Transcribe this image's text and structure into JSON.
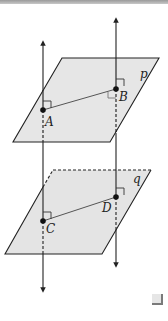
{
  "diagram": {
    "planes": [
      {
        "id": "p",
        "label": "p"
      },
      {
        "id": "q",
        "label": "q"
      }
    ],
    "points": [
      {
        "id": "A",
        "label": "A",
        "plane": "p"
      },
      {
        "id": "B",
        "label": "B",
        "plane": "p"
      },
      {
        "id": "C",
        "label": "C",
        "plane": "q"
      },
      {
        "id": "D",
        "label": "D",
        "plane": "q"
      }
    ],
    "segments": [
      {
        "from": "A",
        "to": "B"
      },
      {
        "from": "C",
        "to": "D"
      }
    ],
    "lines": [
      {
        "id": "line-through-A-C",
        "through": [
          "A",
          "C"
        ],
        "perpendicular_to": [
          "p",
          "q"
        ]
      },
      {
        "id": "line-through-B-D",
        "through": [
          "B",
          "D"
        ],
        "perpendicular_to": [
          "p",
          "q"
        ]
      }
    ],
    "right_angle_marks": [
      "A",
      "B",
      "C",
      "D"
    ],
    "colors": {
      "plane_fill": "#e4e4e4",
      "stroke": "#222222",
      "segment": "#555555",
      "border": "#9a9a9a"
    },
    "end_marker": "end-of-proof-square"
  }
}
